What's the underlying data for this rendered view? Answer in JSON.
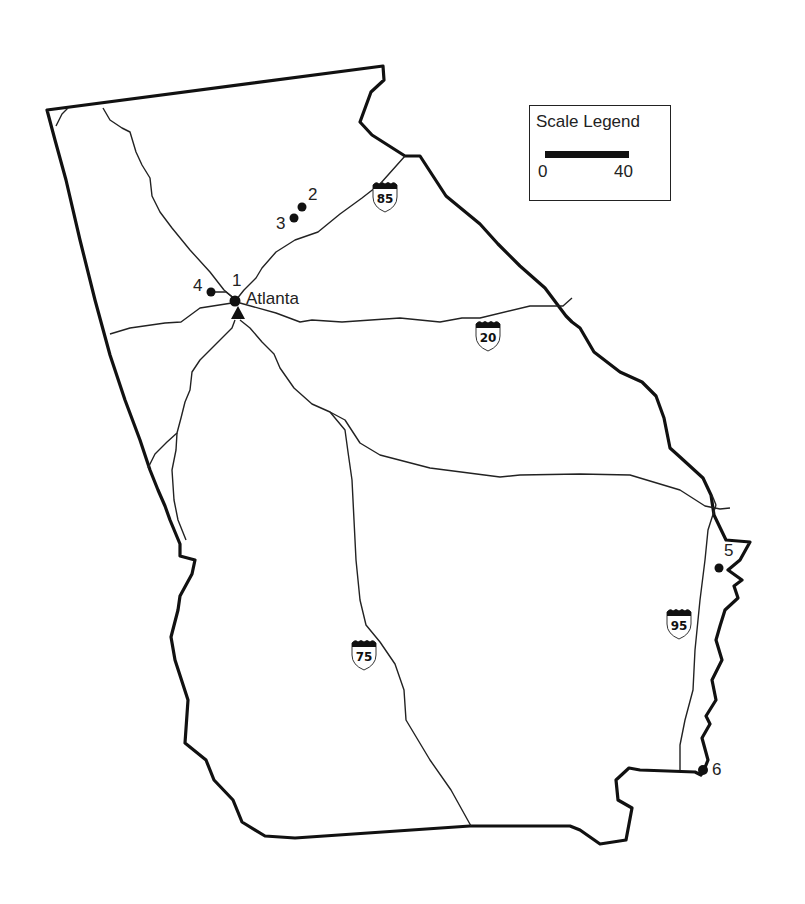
{
  "map": {
    "title": "Georgia highway map",
    "city_label": "Atlanta",
    "sites": [
      {
        "id": "1",
        "label": "1"
      },
      {
        "id": "2",
        "label": "2"
      },
      {
        "id": "3",
        "label": "3"
      },
      {
        "id": "4",
        "label": "4"
      },
      {
        "id": "5",
        "label": "5"
      },
      {
        "id": "6",
        "label": "6"
      }
    ],
    "interstates": [
      {
        "number": "85"
      },
      {
        "number": "20"
      },
      {
        "number": "75"
      },
      {
        "number": "95"
      }
    ]
  },
  "legend": {
    "title": "Scale Legend",
    "min_label": "0",
    "max_label": "40"
  }
}
